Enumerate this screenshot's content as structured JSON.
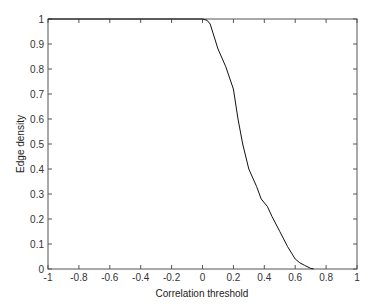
{
  "chart_data": {
    "type": "line",
    "title": "",
    "xlabel": "Correlation threshold",
    "ylabel": "Edge density",
    "xlim": [
      -1,
      1
    ],
    "ylim": [
      0,
      1
    ],
    "grid": false,
    "legend": null,
    "xticks": [
      -1,
      -0.8,
      -0.6,
      -0.4,
      -0.2,
      0,
      0.2,
      0.4,
      0.6,
      0.8,
      1
    ],
    "xtick_labels": [
      "-1",
      "-0.8",
      "-0.6",
      "-0.4",
      "-0.2",
      "0",
      "0.2",
      "0.4",
      "0.6",
      "0.8",
      "1"
    ],
    "yticks": [
      0,
      0.1,
      0.2,
      0.3,
      0.4,
      0.5,
      0.6,
      0.7,
      0.8,
      0.9,
      1
    ],
    "ytick_labels": [
      "0",
      "0.1",
      "0.2",
      "0.3",
      "0.4",
      "0.5",
      "0.6",
      "0.7",
      "0.8",
      "0.9",
      "1"
    ],
    "series": [
      {
        "name": "Edge density",
        "color": "#111111",
        "x": [
          -1,
          -0.5,
          0,
          0.03,
          0.05,
          0.07,
          0.1,
          0.15,
          0.2,
          0.23,
          0.26,
          0.3,
          0.35,
          0.38,
          0.42,
          0.45,
          0.5,
          0.55,
          0.6,
          0.63,
          0.66,
          0.7,
          0.72
        ],
        "y": [
          1,
          1,
          1,
          0.995,
          0.98,
          0.94,
          0.88,
          0.81,
          0.72,
          0.6,
          0.5,
          0.4,
          0.33,
          0.28,
          0.25,
          0.21,
          0.15,
          0.09,
          0.04,
          0.025,
          0.015,
          0.003,
          0
        ]
      }
    ]
  }
}
